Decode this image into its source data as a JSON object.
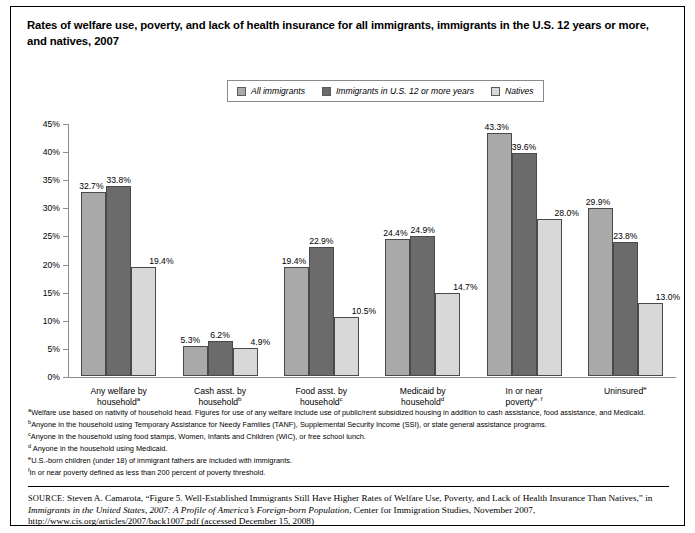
{
  "title": "Rates of welfare use, poverty, and lack of health insurance for all immigrants, immigrants in the U.S. 12 years or more, and natives, 2007",
  "legend": {
    "items": [
      {
        "label": "All immigrants",
        "color": "#a9a9a9"
      },
      {
        "label": "Immigrants in U.S. 12 or more years",
        "color": "#6b6b6b"
      },
      {
        "label": "Natives",
        "color": "#d8d8d8"
      }
    ]
  },
  "chart_data": {
    "type": "bar",
    "title": "Rates of welfare use, poverty, and lack of health insurance for all immigrants, immigrants in the U.S. 12 years or more, and natives, 2007",
    "xlabel": "",
    "ylabel": "",
    "ylim": [
      0,
      45
    ],
    "ytick_labels": [
      "0%",
      "5%",
      "10%",
      "15%",
      "20%",
      "25%",
      "30%",
      "35%",
      "40%",
      "45%"
    ],
    "ytick_values": [
      0,
      5,
      10,
      15,
      20,
      25,
      30,
      35,
      40,
      45
    ],
    "grid": false,
    "legend_position": "top-center",
    "categories": [
      "Any welfare by household",
      "Cash asst. by household",
      "Food asst. by household",
      "Medicaid by household",
      "In or near poverty",
      "Uninsured"
    ],
    "category_lines": [
      {
        "line1": "Any welfare by",
        "line2": "household",
        "sup": "a"
      },
      {
        "line1": "Cash asst. by",
        "line2": "household",
        "sup": "b"
      },
      {
        "line1": "Food asst. by",
        "line2": "household",
        "sup": "c"
      },
      {
        "line1": "Medicaid by",
        "line2": "household",
        "sup": "d"
      },
      {
        "line1": "In or near",
        "line2": "poverty",
        "sup": "e, f"
      },
      {
        "line1": "Uninsured",
        "line2": "",
        "sup": "e"
      }
    ],
    "series": [
      {
        "name": "All immigrants",
        "color": "#a9a9a9",
        "values": [
          32.7,
          5.3,
          19.4,
          24.4,
          43.3,
          29.9
        ],
        "labels": [
          "32.7%",
          "5.3%",
          "19.4%",
          "24.4%",
          "43.3%",
          "29.9%"
        ]
      },
      {
        "name": "Immigrants in U.S. 12 or more years",
        "color": "#6b6b6b",
        "values": [
          33.8,
          6.2,
          22.9,
          24.9,
          39.6,
          23.8
        ],
        "labels": [
          "33.8%",
          "6.2%",
          "22.9%",
          "24.9%",
          "39.6%",
          "23.8%"
        ]
      },
      {
        "name": "Natives",
        "color": "#d8d8d8",
        "values": [
          19.4,
          4.9,
          10.5,
          14.7,
          28.0,
          13.0
        ],
        "labels": [
          "19.4%",
          "4.9%",
          "10.5%",
          "14.7%",
          "28.0%",
          "13.0%"
        ]
      }
    ]
  },
  "footnotes": [
    {
      "marker": "a",
      "text": "Welfare use based on nativity of household head. Figures for use of any welfare include use of public/rent subsidized housing in addition to cash assistance, food assistance, and Medicaid."
    },
    {
      "marker": "b",
      "text": "Anyone in the household using Temporary Assistance for Needy Families (TANF), Supplemental Security Income (SSI), or state general assistance programs."
    },
    {
      "marker": "c",
      "text": "Anyone in the household using food stamps, Women, Infants and Children (WIC), or free school lunch."
    },
    {
      "marker": "d",
      "text": " Anyone in the household using Medicaid."
    },
    {
      "marker": "e",
      "text": "U.S.-born children (under 18) of immigrant fathers are included with immigrants."
    },
    {
      "marker": "f",
      "text": "In or near poverty defined as less than 200 percent of poverty threshold."
    }
  ],
  "source": {
    "prefix": "SOURCE:",
    "part1": " Steven A. Camarota, “Figure 5. Well-Established Immigrants Still Have Higher Rates of Welfare Use, Poverty, and Lack of Health Insurance Than Natives,” in ",
    "italic": "Immigrants in the United States, 2007: A Profile of America’s Foreign-born Population",
    "part2": ", Center for Immigration Studies, November 2007, http://www.cis.org/articles/2007/back1007.pdf (accessed December 15, 2008)"
  }
}
